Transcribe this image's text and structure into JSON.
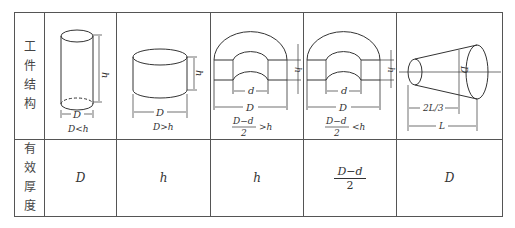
{
  "table": {
    "row_headers": [
      {
        "label": "工件结构",
        "chars": [
          "工",
          "件",
          "结",
          "构"
        ]
      },
      {
        "label": "有效厚度",
        "chars": [
          "有",
          "效",
          "厚",
          "度"
        ]
      }
    ],
    "structures": [
      {
        "shape": "tall-cylinder",
        "dims": {
          "height": "h",
          "width": "D"
        },
        "condition": "D<h"
      },
      {
        "shape": "short-cylinder",
        "dims": {
          "height": "h",
          "width": "D"
        },
        "condition": "D>h"
      },
      {
        "shape": "ring-section",
        "dims": {
          "inner": "d",
          "outer": "D",
          "height": "h"
        },
        "condition": {
          "numerator": "D−d",
          "denominator": "2",
          "relation": ">h"
        }
      },
      {
        "shape": "ring-section",
        "dims": {
          "inner": "d",
          "outer": "D",
          "height": "h"
        },
        "condition": {
          "numerator": "D−d",
          "denominator": "2",
          "relation": "<h"
        }
      },
      {
        "shape": "truncated-cone",
        "dims": {
          "diameter": "D",
          "partial": "2L/3",
          "length": "L"
        },
        "condition": ""
      }
    ],
    "effective_thickness": [
      {
        "value": "D"
      },
      {
        "value": "h"
      },
      {
        "value": "h"
      },
      {
        "fraction": {
          "numerator": "D−d",
          "denominator": "2"
        }
      },
      {
        "value": "D"
      }
    ]
  }
}
